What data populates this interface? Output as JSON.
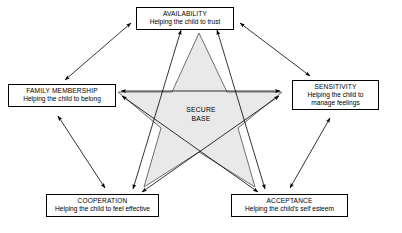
{
  "diagram": {
    "center": {
      "name": "secure-base",
      "line1": "SECURE",
      "line2": "BASE",
      "fill": "#e9e9e9",
      "stroke": "#666666"
    },
    "nodes": [
      {
        "id": "availability",
        "title": "AVAILABILITY",
        "subtitle": "Helping the child to trust"
      },
      {
        "id": "family-membership",
        "title": "FAMILY MEMBERSHIP",
        "subtitle": "Helping the child to belong"
      },
      {
        "id": "sensitivity",
        "title": "SENSITIVITY",
        "subtitle_line1": "Helping the child to",
        "subtitle_line2": "manage feelings"
      },
      {
        "id": "cooperation",
        "title": "COOPERATION",
        "subtitle": "Helping the child to feel effective"
      },
      {
        "id": "acceptance",
        "title": "ACCEPTANCE",
        "subtitle": "Helping the child's self esteem"
      }
    ],
    "colors": {
      "line": "#000000",
      "star_fill": "#e9e9e9",
      "star_stroke": "#6f6f6f",
      "box_border": "#000000",
      "background": "#ffffff",
      "text": "#000000"
    }
  }
}
